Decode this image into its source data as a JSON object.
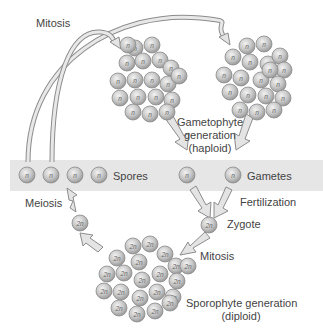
{
  "labels": {
    "mitosis_top": "Mitosis",
    "gametophyte_line1": "Gametophyte",
    "gametophyte_line2": "generation",
    "gametophyte_line3": "(haploid)",
    "spores": "Spores",
    "gametes": "Gametes",
    "fertilization": "Fertilization",
    "meiosis": "Meiosis",
    "zygote": "Zygote",
    "mitosis_bottom": "Mitosis",
    "sporophyte_line1": "Sporophyte generation",
    "sporophyte_line2": "(diploid)"
  },
  "cell_labels": {
    "haploid": "n",
    "diploid": "2n"
  },
  "colors": {
    "band": "#e6e6e6",
    "cell_fill": "#c8c8c8",
    "cell_stroke": "#8a8a8a",
    "arrow_fill": "#e4e4e4",
    "arrow_stroke": "#8c8c8c",
    "text": "#444444"
  }
}
